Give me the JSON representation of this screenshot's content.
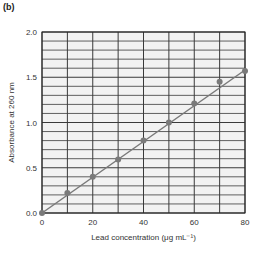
{
  "panel_label": "(b)",
  "chart_data": {
    "type": "scatter",
    "title": "",
    "xlabel": "Lead concentration (μg mL⁻¹)",
    "ylabel": "Absorbance at 260 nm",
    "xlim": [
      0,
      80
    ],
    "ylim": [
      0.0,
      2.0
    ],
    "x_ticks": [
      "0",
      "20",
      "40",
      "60",
      "80"
    ],
    "y_ticks": [
      "0.0",
      "0.5",
      "1.0",
      "1.5",
      "2.0"
    ],
    "grid": true,
    "series": [
      {
        "name": "measured",
        "x": [
          0,
          10,
          20,
          30,
          40,
          50,
          60,
          70,
          80
        ],
        "y": [
          0.0,
          0.22,
          0.4,
          0.59,
          0.8,
          1.0,
          1.21,
          1.45,
          1.57
        ]
      }
    ],
    "fit_line": {
      "x": [
        0,
        80
      ],
      "y": [
        0.0,
        1.58
      ]
    },
    "colors": {
      "point": "#7a7a7a",
      "line": "#7a7a7a",
      "grid": "#3a3a3a",
      "plot_bg": "#f2f2f2"
    }
  }
}
